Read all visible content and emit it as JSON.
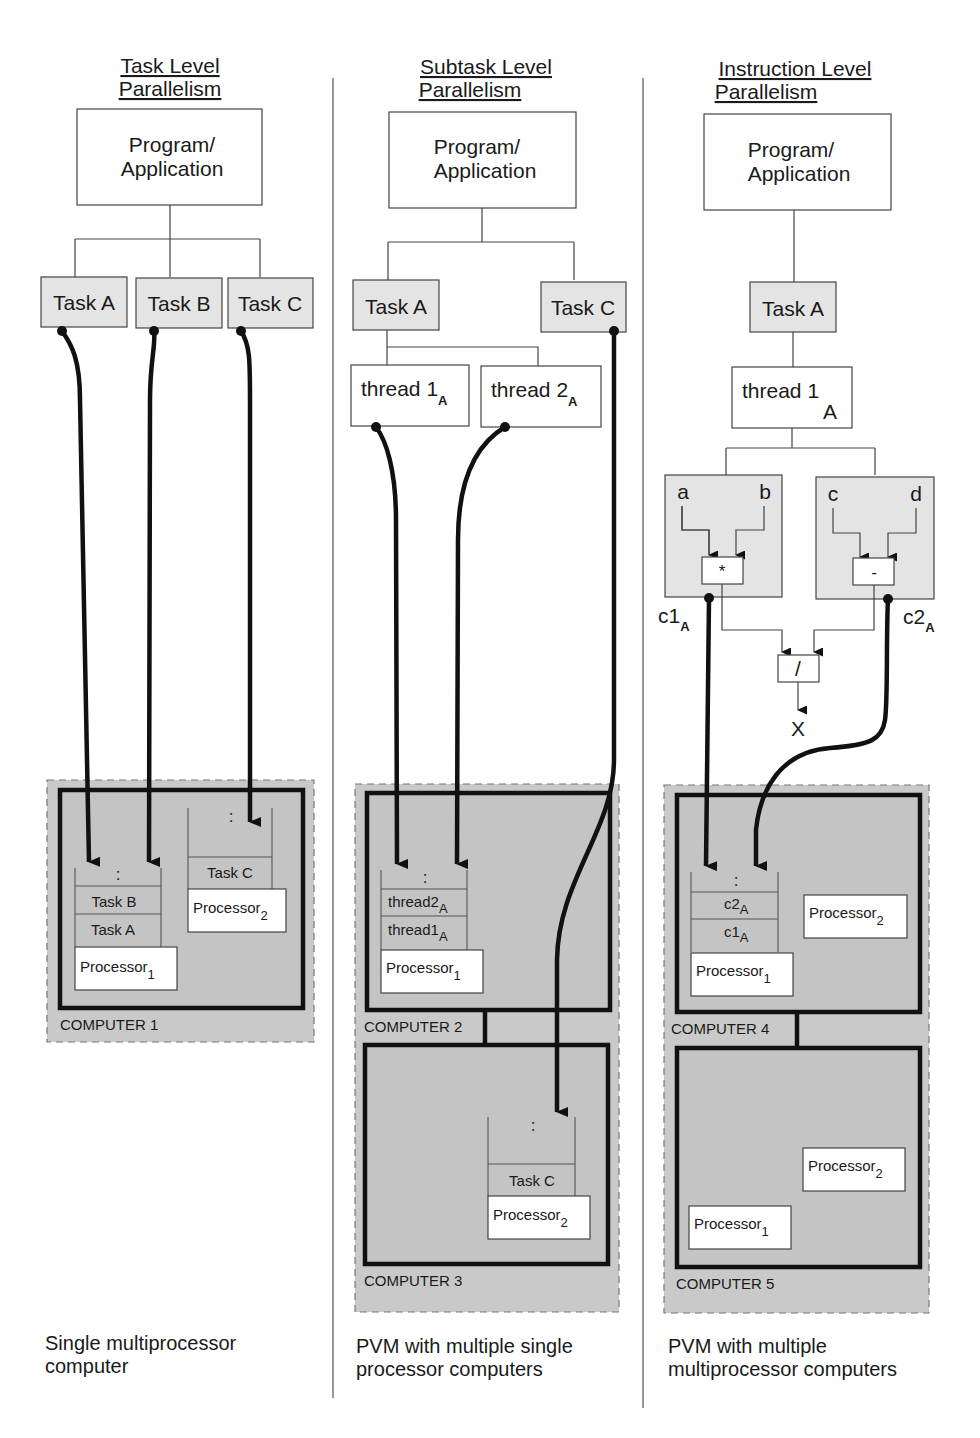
{
  "columns": [
    {
      "title_line1": "Task Level",
      "title_line2": "Parallelism",
      "program_line1": "Program/",
      "program_line2": "Application",
      "tasks": [
        "Task A",
        "Task B",
        "Task C"
      ],
      "computers": [
        {
          "label": "COMPUTER 1",
          "processors": [
            {
              "name": "Processor",
              "sub": "1",
              "queue": [
                ":",
                "Task B",
                "Task A"
              ]
            },
            {
              "name": "Processor",
              "sub": "2",
              "queue": [
                ":",
                "Task C"
              ]
            }
          ]
        }
      ],
      "caption_line1": "Single multiprocessor",
      "caption_line2": "computer"
    },
    {
      "title_line1": "Subtask Level",
      "title_line2": "Parallelism",
      "program_line1": "Program/",
      "program_line2": "Application",
      "tasks": [
        "Task A",
        "Task C"
      ],
      "threads": [
        {
          "name": "thread 1",
          "sub": "A"
        },
        {
          "name": "thread 2",
          "sub": "A"
        }
      ],
      "computers": [
        {
          "label": "COMPUTER 2",
          "processors": [
            {
              "name": "Processor",
              "sub": "1",
              "queue": [
                ":",
                "thread2|A",
                "thread1|A"
              ]
            }
          ]
        },
        {
          "label": "COMPUTER 3",
          "processors": [
            {
              "name": "Processor",
              "sub": "2",
              "queue": [
                ":",
                "Task C"
              ]
            }
          ]
        }
      ],
      "caption_line1": "PVM with multiple single",
      "caption_line2": "processor computers"
    },
    {
      "title_line1": "Instruction Level",
      "title_line2": "Parallelism",
      "program_line1": "Program/",
      "program_line2": "Application",
      "tasks": [
        "Task A"
      ],
      "threads": [
        {
          "name": "thread 1",
          "sub": "A"
        }
      ],
      "operations": [
        {
          "inputs": [
            "a",
            "b"
          ],
          "op": "*",
          "result": "c1",
          "result_sub": "A"
        },
        {
          "inputs": [
            "c",
            "d"
          ],
          "op": "-",
          "result": "c2",
          "result_sub": "A"
        }
      ],
      "combine_op": "/",
      "output": "X",
      "computers": [
        {
          "label": "COMPUTER 4",
          "processors": [
            {
              "name": "Processor",
              "sub": "1",
              "queue": [
                ":",
                "c2|A",
                "c1|A"
              ]
            },
            {
              "name": "Processor",
              "sub": "2",
              "queue": []
            }
          ]
        },
        {
          "label": "COMPUTER 5",
          "processors": [
            {
              "name": "Processor",
              "sub": "2",
              "queue": []
            },
            {
              "name": "Processor",
              "sub": "1",
              "queue": []
            }
          ]
        }
      ],
      "caption_line1": "PVM with multiple",
      "caption_line2": "multiprocessor computers"
    }
  ]
}
